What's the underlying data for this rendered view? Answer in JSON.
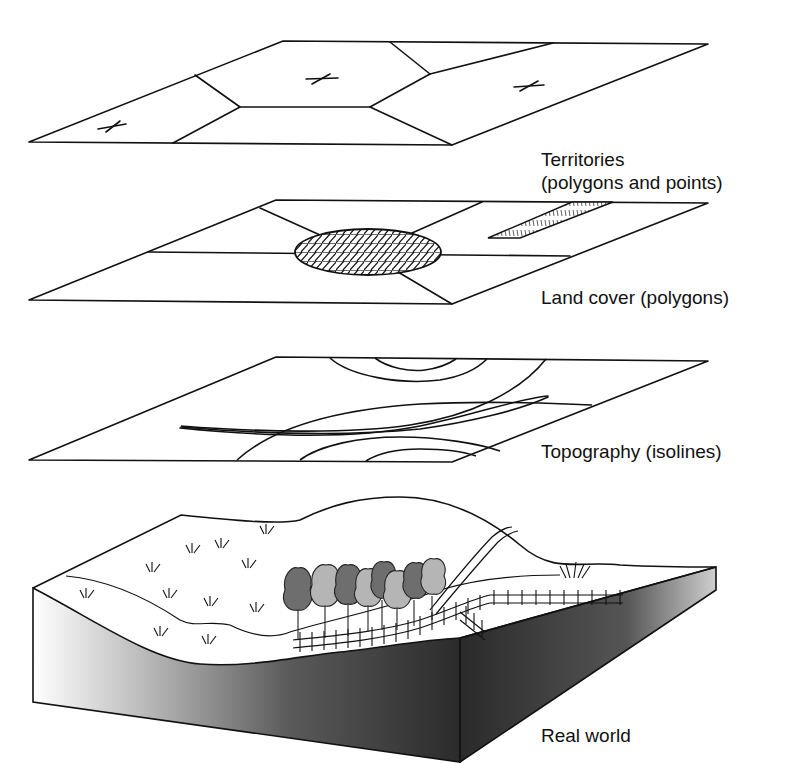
{
  "diagram": {
    "type": "GIS thematic layers stacked over real world",
    "layers": [
      {
        "id": "territories",
        "label_line1": "Territories",
        "label_line2": "(polygons and points)",
        "features": [
          "polygons",
          "points"
        ]
      },
      {
        "id": "land-cover",
        "label": "Land cover (polygons)",
        "features": [
          "polygons",
          "hatched ellipse",
          "hatched strip"
        ]
      },
      {
        "id": "topography",
        "label": "Topography (isolines)",
        "features": [
          "isolines"
        ]
      },
      {
        "id": "real-world",
        "label": "Real world",
        "features": [
          "hill",
          "grass",
          "trees",
          "fence",
          "stream",
          "road"
        ]
      }
    ],
    "colors": {
      "line": "#111111",
      "tree_dark": "#6e6e6e",
      "tree_light": "#b5b5b5",
      "block_dark": "#2a2a2a",
      "background": "#ffffff"
    }
  }
}
